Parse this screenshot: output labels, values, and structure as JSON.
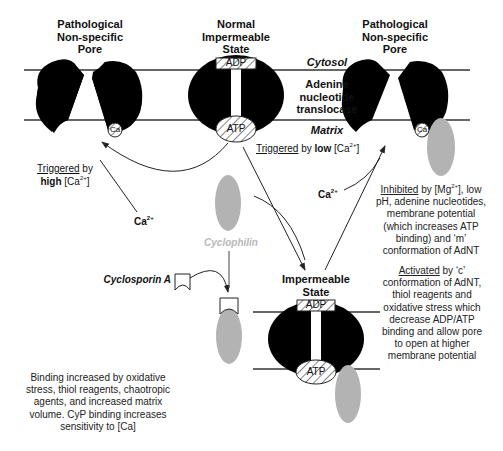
{
  "diagram": {
    "states": {
      "left_pore": {
        "title_lines": [
          "Pathological",
          "Non-specific",
          "Pore"
        ],
        "ion": "Ca"
      },
      "normal": {
        "title_lines": [
          "Normal",
          "Impermeable",
          "State"
        ],
        "top_site": "ADP",
        "bottom_site": "ATP"
      },
      "right_pore": {
        "title_lines": [
          "Pathological",
          "Non-specific",
          "Pore"
        ],
        "ion": "Ca"
      },
      "impermeable": {
        "title_lines": [
          "Impermeable",
          "State"
        ],
        "top_site": "ADP",
        "bottom_site": "ATP"
      }
    },
    "compartments": {
      "cytosol": "Cytosol",
      "protein_lines": [
        "Adenine",
        "nucleotide",
        "translocase"
      ],
      "matrix": "Matrix"
    },
    "annotations": {
      "triggered_high": {
        "underlined": "Triggered",
        "rest1": " by",
        "bold": "high",
        "ion": " [Ca",
        "charge": "2+",
        "close": "]"
      },
      "triggered_low": {
        "underlined": "Triggered",
        "rest1": " by ",
        "bold": "low",
        "ion": " [Ca",
        "charge": "2+",
        "close": "]"
      },
      "ca_left": {
        "ion": "Ca",
        "charge": "2+"
      },
      "ca_right": {
        "ion": "Ca",
        "charge": "2+"
      },
      "cyclophilin": "Cyclophilin",
      "cyclosporin": "Cyclosporin A",
      "inhibited": {
        "underlined": "Inhibited",
        "line1_rest": " by [Mg",
        "charge": "2+",
        "line1_end": "], low",
        "lines": [
          "pH, adenine nucleotides,",
          "membrane potential",
          "(which increases ATP",
          "binding) and ‘m’",
          "conformation of AdNT"
        ]
      },
      "activated": {
        "underlined": "Activated",
        "line1_rest": " by ‘c’",
        "lines": [
          "conformation of AdNT,",
          "thiol reagents and",
          "oxidative stress which",
          "decrease ADP/ATP",
          "binding and allow pore",
          "to open at higher",
          "membrane potential"
        ]
      },
      "binding_note": {
        "lines": [
          "Binding increased by oxidative",
          "stress, thiol reagents, chaotropic",
          "agents, and increased matrix",
          "volume. CyP binding increases",
          "sensitivity to [Ca]"
        ]
      }
    },
    "colors": {
      "protein": "#000000",
      "cyclophilin": "#b3b3b3",
      "cyclophilin_label": "#b8b8b8",
      "membrane_line": "#333333",
      "arrow": "#222222"
    }
  }
}
